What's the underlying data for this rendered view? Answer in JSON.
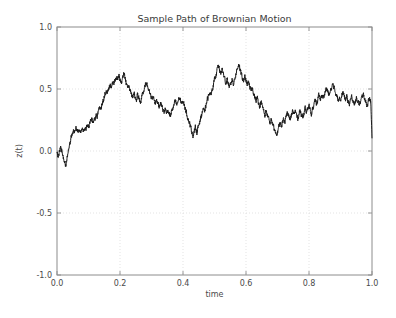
{
  "chart_data": {
    "type": "line",
    "title": "Sample Path of Brownian Motion",
    "xlabel": "time",
    "ylabel": "z(t)",
    "xlim": [
      0.0,
      1.0
    ],
    "ylim": [
      -1.0,
      1.0
    ],
    "xticks": [
      "0.0",
      "0.2",
      "0.4",
      "0.6",
      "0.8",
      "1.0"
    ],
    "xtick_values": [
      0.0,
      0.2,
      0.4,
      0.6,
      0.8,
      1.0
    ],
    "yticks": [
      "-1.0",
      "-0.5",
      "0.0",
      "0.5",
      "1.0"
    ],
    "ytick_values": [
      -1.0,
      -0.5,
      0.0,
      0.5,
      1.0
    ],
    "grid": true,
    "grid_style": "dotted",
    "grid_color": "#dcdcdc",
    "legend": "none",
    "line_color": "#1a1a1a",
    "line_width": 1.0,
    "series": [
      {
        "name": "z(t)",
        "x": [
          0.0,
          0.004,
          0.008,
          0.012,
          0.016,
          0.02,
          0.024,
          0.028,
          0.032,
          0.036,
          0.04,
          0.044,
          0.048,
          0.052,
          0.056,
          0.06,
          0.064,
          0.068,
          0.072,
          0.076,
          0.08,
          0.084,
          0.088,
          0.092,
          0.096,
          0.1,
          0.104,
          0.108,
          0.112,
          0.116,
          0.12,
          0.124,
          0.128,
          0.132,
          0.136,
          0.14,
          0.144,
          0.148,
          0.152,
          0.156,
          0.16,
          0.164,
          0.168,
          0.172,
          0.176,
          0.18,
          0.184,
          0.188,
          0.192,
          0.196,
          0.2,
          0.204,
          0.208,
          0.212,
          0.216,
          0.22,
          0.224,
          0.228,
          0.232,
          0.236,
          0.24,
          0.244,
          0.248,
          0.252,
          0.256,
          0.26,
          0.264,
          0.268,
          0.272,
          0.276,
          0.28,
          0.284,
          0.288,
          0.292,
          0.296,
          0.3,
          0.304,
          0.308,
          0.312,
          0.316,
          0.32,
          0.324,
          0.328,
          0.332,
          0.336,
          0.34,
          0.344,
          0.348,
          0.352,
          0.356,
          0.36,
          0.364,
          0.368,
          0.372,
          0.376,
          0.38,
          0.384,
          0.388,
          0.392,
          0.396,
          0.4,
          0.404,
          0.408,
          0.412,
          0.416,
          0.42,
          0.424,
          0.428,
          0.432,
          0.436,
          0.44,
          0.444,
          0.448,
          0.452,
          0.456,
          0.46,
          0.464,
          0.468,
          0.472,
          0.476,
          0.48,
          0.484,
          0.488,
          0.492,
          0.496,
          0.5,
          0.504,
          0.508,
          0.512,
          0.516,
          0.52,
          0.524,
          0.528,
          0.532,
          0.536,
          0.54,
          0.544,
          0.548,
          0.552,
          0.556,
          0.56,
          0.564,
          0.568,
          0.572,
          0.576,
          0.58,
          0.584,
          0.588,
          0.592,
          0.596,
          0.6,
          0.604,
          0.608,
          0.612,
          0.616,
          0.62,
          0.624,
          0.628,
          0.632,
          0.636,
          0.64,
          0.644,
          0.648,
          0.652,
          0.656,
          0.66,
          0.664,
          0.668,
          0.672,
          0.676,
          0.68,
          0.684,
          0.688,
          0.692,
          0.696,
          0.7,
          0.704,
          0.708,
          0.712,
          0.716,
          0.72,
          0.724,
          0.728,
          0.732,
          0.736,
          0.74,
          0.744,
          0.748,
          0.752,
          0.756,
          0.76,
          0.764,
          0.768,
          0.772,
          0.776,
          0.78,
          0.784,
          0.788,
          0.792,
          0.796,
          0.8,
          0.804,
          0.808,
          0.812,
          0.816,
          0.82,
          0.824,
          0.828,
          0.832,
          0.836,
          0.84,
          0.844,
          0.848,
          0.852,
          0.856,
          0.86,
          0.864,
          0.868,
          0.872,
          0.876,
          0.88,
          0.884,
          0.888,
          0.892,
          0.896,
          0.9,
          0.904,
          0.908,
          0.912,
          0.916,
          0.92,
          0.924,
          0.928,
          0.932,
          0.936,
          0.94,
          0.944,
          0.948,
          0.952,
          0.956,
          0.96,
          0.964,
          0.968,
          0.972,
          0.976,
          0.98,
          0.984,
          0.988,
          0.992,
          0.996,
          1.0
        ],
        "y": [
          -0.02,
          -0.055,
          0.01,
          0.035,
          -0.01,
          -0.06,
          -0.095,
          -0.11,
          -0.055,
          0.01,
          0.055,
          0.09,
          0.14,
          0.175,
          0.155,
          0.195,
          0.175,
          0.16,
          0.185,
          0.165,
          0.18,
          0.165,
          0.185,
          0.175,
          0.21,
          0.185,
          0.23,
          0.265,
          0.245,
          0.23,
          0.25,
          0.285,
          0.275,
          0.33,
          0.355,
          0.33,
          0.39,
          0.42,
          0.455,
          0.49,
          0.46,
          0.5,
          0.545,
          0.52,
          0.56,
          0.535,
          0.57,
          0.6,
          0.57,
          0.61,
          0.58,
          0.545,
          0.575,
          0.62,
          0.59,
          0.545,
          0.5,
          0.53,
          0.495,
          0.46,
          0.43,
          0.47,
          0.44,
          0.415,
          0.455,
          0.425,
          0.395,
          0.42,
          0.455,
          0.49,
          0.52,
          0.555,
          0.52,
          0.48,
          0.45,
          0.42,
          0.445,
          0.41,
          0.385,
          0.42,
          0.39,
          0.36,
          0.395,
          0.37,
          0.34,
          0.31,
          0.34,
          0.305,
          0.335,
          0.305,
          0.28,
          0.32,
          0.345,
          0.375,
          0.4,
          0.37,
          0.4,
          0.43,
          0.405,
          0.375,
          0.4,
          0.37,
          0.34,
          0.3,
          0.265,
          0.23,
          0.195,
          0.16,
          0.125,
          0.16,
          0.195,
          0.15,
          0.185,
          0.23,
          0.265,
          0.3,
          0.345,
          0.31,
          0.355,
          0.4,
          0.44,
          0.475,
          0.445,
          0.49,
          0.53,
          0.57,
          0.61,
          0.65,
          0.69,
          0.655,
          0.62,
          0.66,
          0.625,
          0.59,
          0.545,
          0.58,
          0.545,
          0.51,
          0.545,
          0.58,
          0.545,
          0.58,
          0.62,
          0.66,
          0.7,
          0.665,
          0.63,
          0.595,
          0.56,
          0.6,
          0.565,
          0.53,
          0.56,
          0.52,
          0.48,
          0.51,
          0.47,
          0.435,
          0.4,
          0.43,
          0.395,
          0.36,
          0.395,
          0.36,
          0.325,
          0.29,
          0.325,
          0.29,
          0.255,
          0.22,
          0.255,
          0.22,
          0.19,
          0.155,
          0.12,
          0.155,
          0.195,
          0.23,
          0.2,
          0.235,
          0.27,
          0.24,
          0.28,
          0.315,
          0.285,
          0.25,
          0.285,
          0.32,
          0.29,
          0.325,
          0.295,
          0.26,
          0.295,
          0.33,
          0.3,
          0.265,
          0.3,
          0.335,
          0.305,
          0.34,
          0.37,
          0.34,
          0.305,
          0.34,
          0.375,
          0.41,
          0.38,
          0.415,
          0.45,
          0.42,
          0.45,
          0.42,
          0.45,
          0.48,
          0.51,
          0.48,
          0.45,
          0.48,
          0.51,
          0.535,
          0.505,
          0.475,
          0.445,
          0.415,
          0.445,
          0.41,
          0.44,
          0.47,
          0.44,
          0.41,
          0.44,
          0.405,
          0.375,
          0.405,
          0.435,
          0.405,
          0.375,
          0.405,
          0.43,
          0.4,
          0.37,
          0.4,
          0.43,
          0.46,
          0.43,
          0.4,
          0.37,
          0.395,
          0.42,
          0.39,
          0.11
        ],
        "summary_points": [
          {
            "t": 0.0,
            "z": -0.02,
            "note": "start"
          },
          {
            "t": 0.015,
            "z": -0.11,
            "note": "early dip"
          },
          {
            "t": 0.1,
            "z": 0.22
          },
          {
            "t": 0.135,
            "z": 0.63,
            "note": "first major peak"
          },
          {
            "t": 0.2,
            "z": 0.57
          },
          {
            "t": 0.235,
            "z": 0.36
          },
          {
            "t": 0.275,
            "z": 0.43
          },
          {
            "t": 0.305,
            "z": 0.11,
            "note": "local trough"
          },
          {
            "t": 0.345,
            "z": 0.69,
            "note": "highest peak"
          },
          {
            "t": 0.365,
            "z": 0.49
          },
          {
            "t": 0.385,
            "z": 0.7,
            "note": "global maximum"
          },
          {
            "t": 0.455,
            "z": 0.13
          },
          {
            "t": 0.5,
            "z": 0.33
          },
          {
            "t": 0.545,
            "z": 0.26
          },
          {
            "t": 0.595,
            "z": 0.53,
            "note": "later peak"
          },
          {
            "t": 0.655,
            "z": 0.38
          },
          {
            "t": 0.685,
            "z": 0.48
          },
          {
            "t": 0.765,
            "z": -0.1
          },
          {
            "t": 0.79,
            "z": -0.15
          },
          {
            "t": 0.83,
            "z": 0.28,
            "note": "rebound"
          },
          {
            "t": 0.87,
            "z": -0.3,
            "note": "global minimum"
          },
          {
            "t": 0.91,
            "z": -0.07
          },
          {
            "t": 0.945,
            "z": -0.22
          },
          {
            "t": 0.98,
            "z": 0.16
          },
          {
            "t": 1.0,
            "z": 0.1,
            "note": "end"
          }
        ]
      }
    ]
  },
  "figure": {
    "title": "Sample Path of Brownian Motion",
    "xlabel": "time",
    "ylabel": "z(t)"
  }
}
